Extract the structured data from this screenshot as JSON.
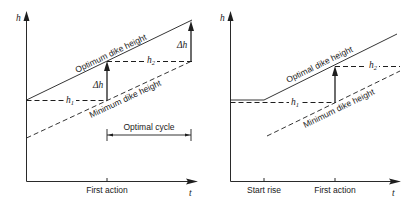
{
  "left_panel": {
    "y_axis_label": "h",
    "x_axis_label": "t",
    "x_tick_first_action": "First action",
    "optimum_line_label": "Optimum dike height",
    "minimum_line_label": "Minimum dike height",
    "h1_label": "h",
    "h1_sub": "1",
    "h2_label": "h",
    "h2_sub": "2",
    "delta_h_label_1": "Δh",
    "delta_h_label_2": "Δh",
    "cycle_label": "Optimal cycle"
  },
  "right_panel": {
    "y_axis_label": "h",
    "x_axis_label": "t",
    "x_tick_start_rise": "Start rise",
    "x_tick_first_action": "First action",
    "optimal_line_label": "Optimal dike height",
    "minimum_line_label": "Minimum dike height",
    "h1_label": "h",
    "h1_sub": "1",
    "h2_label": "h",
    "h2_sub": "2"
  }
}
